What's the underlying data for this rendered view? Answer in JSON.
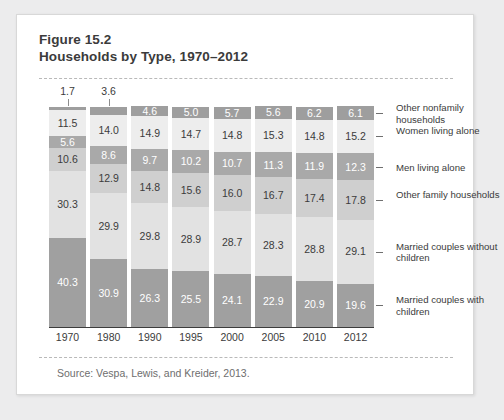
{
  "figure": {
    "label": "Figure 15.2",
    "title": "Households by Type, 1970–2012",
    "source": "Source:  Vespa, Lewis, and Kreider, 2013."
  },
  "chart_data": {
    "type": "bar",
    "stacked": true,
    "title": "Households by Type, 1970–2012",
    "xlabel": "",
    "ylabel": "",
    "ylim": [
      0,
      100
    ],
    "grid": false,
    "legend_position": "right",
    "units": "percent",
    "categories": [
      "1970",
      "1980",
      "1990",
      "1995",
      "2000",
      "2005",
      "2010",
      "2012"
    ],
    "series": [
      {
        "name": "Married couples with children",
        "values": [
          40.3,
          30.9,
          26.3,
          25.5,
          24.1,
          22.9,
          20.9,
          19.6
        ],
        "color": "#a0a0a0"
      },
      {
        "name": "Married couples without children",
        "values": [
          30.3,
          29.9,
          29.8,
          28.9,
          28.7,
          28.3,
          28.8,
          29.1
        ],
        "color": "#e2e2e2"
      },
      {
        "name": "Other family households",
        "values": [
          10.6,
          12.9,
          14.8,
          15.6,
          16.0,
          16.7,
          17.4,
          17.8
        ],
        "color": "#cfcfcf"
      },
      {
        "name": "Men living alone",
        "values": [
          5.6,
          8.6,
          9.7,
          10.2,
          10.7,
          11.3,
          11.9,
          12.3
        ],
        "color": "#a9a9a9"
      },
      {
        "name": "Women living alone",
        "values": [
          11.5,
          14.0,
          14.9,
          14.7,
          14.8,
          15.3,
          14.8,
          15.2
        ],
        "color": "#ededed"
      },
      {
        "name": "Other nonfamily households",
        "values": [
          1.7,
          3.6,
          4.6,
          5.0,
          5.7,
          5.6,
          6.2,
          6.1
        ],
        "color": "#9e9e9e"
      }
    ],
    "legend": [
      "Other nonfamily households",
      "Women living alone",
      "Men living alone",
      "Other family households",
      "Married couples without children",
      "Married couples with children"
    ]
  },
  "colors": {
    "page_background": "#ececed",
    "card_background": "#ffffff",
    "text": "#3b3b3b",
    "axis": "#3c3c3c",
    "dashed_rule": "#b9b9b9"
  }
}
